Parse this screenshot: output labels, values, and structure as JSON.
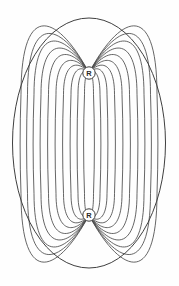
{
  "figure": {
    "background_color": "#fefefe",
    "line_color": "#4a4a4a",
    "boundary_color": "#3f3f3f",
    "width": 179,
    "height": 286
  },
  "nodes": [
    {
      "id": "top-node",
      "label": "R",
      "cx": 89,
      "cy": 73,
      "r": 6.2
    },
    {
      "id": "bottom-node",
      "label": "R",
      "cx": 89,
      "cy": 215,
      "r": 6.2
    }
  ],
  "boundary": {
    "name": "outer-ellipse",
    "cx": 89,
    "cy": 143,
    "rx": 76.5,
    "ry": 125
  },
  "chart_data": {
    "type": "line",
    "subtitle": "",
    "xlabel": "",
    "ylabel": "",
    "grid": false,
    "legend": "none",
    "xlim": [
      0,
      179
    ],
    "ylim": [
      0,
      286
    ],
    "pole_top": {
      "x": 89,
      "y": 73
    },
    "pole_bottom": {
      "x": 89,
      "y": 215
    },
    "loop_count_per_side": 10,
    "loop_half_widths": [
      4.5,
      11,
      18,
      25.5,
      33,
      40.5,
      48,
      55,
      61.5,
      68
    ],
    "loop_apex_extents": [
      0,
      4,
      10,
      18,
      28,
      40,
      53,
      67,
      82,
      97
    ],
    "series": [
      {
        "name": "field-loop-1",
        "half_width": 4.5,
        "apex_extent": 0
      },
      {
        "name": "field-loop-2",
        "half_width": 11,
        "apex_extent": 4
      },
      {
        "name": "field-loop-3",
        "half_width": 18,
        "apex_extent": 10
      },
      {
        "name": "field-loop-4",
        "half_width": 25.5,
        "apex_extent": 18
      },
      {
        "name": "field-loop-5",
        "half_width": 33,
        "apex_extent": 28
      },
      {
        "name": "field-loop-6",
        "half_width": 40.5,
        "apex_extent": 40
      },
      {
        "name": "field-loop-7",
        "half_width": 48,
        "apex_extent": 53
      },
      {
        "name": "field-loop-8",
        "half_width": 55,
        "apex_extent": 67
      },
      {
        "name": "field-loop-9",
        "half_width": 61.5,
        "apex_extent": 82
      },
      {
        "name": "field-loop-10",
        "half_width": 68,
        "apex_extent": 97
      }
    ],
    "annotations": [
      {
        "text": "R",
        "x": 89,
        "y": 73
      },
      {
        "text": "R",
        "x": 89,
        "y": 215
      }
    ]
  }
}
